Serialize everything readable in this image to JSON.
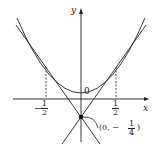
{
  "diagram": {
    "axes": {
      "x_label": "x",
      "y_label": "y",
      "origin_label": "0"
    },
    "ticks": {
      "neg_half": {
        "sign": "−",
        "num": "1",
        "den": "2"
      },
      "pos_half": {
        "num": "1",
        "den": "2"
      }
    },
    "point": {
      "prefix": "(0, −",
      "num": "1",
      "den": "4",
      "suffix": ")"
    },
    "curves": [
      "parabola y = x^2",
      "tangent lines through (0,-1/4)"
    ],
    "colors": {
      "stroke": "#222222",
      "background": "#ffffff"
    }
  }
}
